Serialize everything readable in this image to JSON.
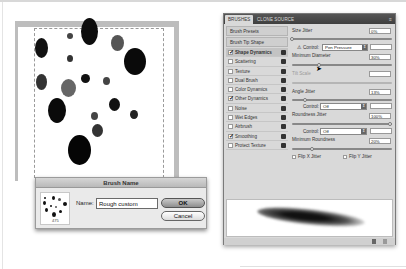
{
  "canvas": {
    "description": "Brush tip canvas with scattered elliptical dots",
    "dots": [
      {
        "x": 70,
        "y": 36,
        "w": 6,
        "h": 6,
        "shade": "#444"
      },
      {
        "x": 89,
        "y": 31,
        "w": 17,
        "h": 27,
        "shade": "#0d0d0d"
      },
      {
        "x": 117,
        "y": 43,
        "w": 13,
        "h": 16,
        "shade": "#555"
      },
      {
        "x": 41,
        "y": 48,
        "w": 13,
        "h": 20,
        "shade": "#111"
      },
      {
        "x": 70,
        "y": 58,
        "w": 6,
        "h": 7,
        "shade": "#333"
      },
      {
        "x": 135,
        "y": 61,
        "w": 22,
        "h": 27,
        "shade": "#0a0a0a"
      },
      {
        "x": 85,
        "y": 78,
        "w": 9,
        "h": 9,
        "shade": "#111"
      },
      {
        "x": 106,
        "y": 81,
        "w": 7,
        "h": 8,
        "shade": "#444"
      },
      {
        "x": 41,
        "y": 82,
        "w": 11,
        "h": 16,
        "shade": "#333"
      },
      {
        "x": 68,
        "y": 88,
        "w": 15,
        "h": 18,
        "shade": "#666"
      },
      {
        "x": 114,
        "y": 104,
        "w": 11,
        "h": 13,
        "shade": "#111"
      },
      {
        "x": 57,
        "y": 110,
        "w": 18,
        "h": 25,
        "shade": "#0a0a0a"
      },
      {
        "x": 94,
        "y": 116,
        "w": 7,
        "h": 8,
        "shade": "#444"
      },
      {
        "x": 134,
        "y": 114,
        "w": 8,
        "h": 9,
        "shade": "#222"
      },
      {
        "x": 97,
        "y": 130,
        "w": 11,
        "h": 13,
        "shade": "#333"
      },
      {
        "x": 79,
        "y": 150,
        "w": 23,
        "h": 30,
        "shade": "#050505"
      }
    ]
  },
  "dialog": {
    "title": "Brush Name",
    "thumbnail_count": "475",
    "name_label": "Name:",
    "name_value": "Rough custom",
    "ok_label": "OK",
    "cancel_label": "Cancel"
  },
  "panel": {
    "tabs": [
      {
        "label": "BRUSHES",
        "active": true
      },
      {
        "label": "CLONE SOURCE",
        "active": false
      }
    ],
    "menu_icon": "≡",
    "list_headers": [
      "Brush Presets",
      "Brush Tip Shape"
    ],
    "list_items": [
      {
        "label": "Shape Dynamics",
        "checked": true,
        "selected": true
      },
      {
        "label": "Scattering",
        "checked": false,
        "selected": false
      },
      {
        "label": "Texture",
        "checked": false,
        "selected": false
      },
      {
        "label": "Dual Brush",
        "checked": false,
        "selected": false
      },
      {
        "label": "Color Dynamics",
        "checked": false,
        "selected": false
      },
      {
        "label": "Other Dynamics",
        "checked": true,
        "selected": false
      },
      {
        "label": "Noise",
        "checked": false,
        "selected": false
      },
      {
        "label": "Wet Edges",
        "checked": false,
        "selected": false
      },
      {
        "label": "Airbrush",
        "checked": false,
        "selected": false
      },
      {
        "label": "Smoothing",
        "checked": true,
        "selected": false
      },
      {
        "label": "Protect Texture",
        "checked": false,
        "selected": false
      }
    ],
    "settings": {
      "size_jitter_label": "Size Jitter",
      "size_jitter_value": "0%",
      "control_label": "Control:",
      "control_value": "Pen Pressure",
      "min_diameter_label": "Minimum Diameter",
      "min_diameter_value": "30%",
      "tilt_scale_label": "Tilt Scale",
      "angle_jitter_label": "Angle Jitter",
      "angle_jitter_value": "13%",
      "angle_control_label": "Control:",
      "angle_control_value": "Off",
      "roundness_jitter_label": "Roundness Jitter",
      "roundness_jitter_value": "100%",
      "roundness_control_label": "Control:",
      "roundness_control_value": "Off",
      "min_roundness_label": "Minimum Roundness",
      "min_roundness_value": "20%",
      "flip_x_label": "Flip X Jitter",
      "flip_y_label": "Flip Y Jitter"
    }
  }
}
